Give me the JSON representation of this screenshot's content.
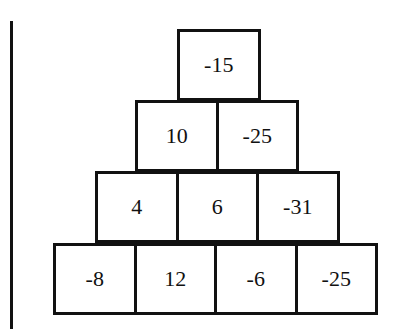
{
  "diagram": {
    "type": "number-pyramid",
    "rows": [
      [
        "-15"
      ],
      [
        "10",
        "-25"
      ],
      [
        "4",
        "6",
        "-31"
      ],
      [
        "-8",
        "12",
        "-6",
        "-25"
      ]
    ]
  }
}
